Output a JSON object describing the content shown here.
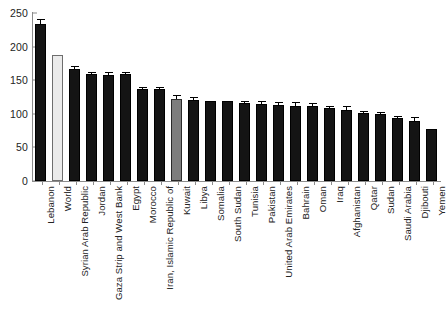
{
  "chart_data": {
    "type": "bar",
    "title": "",
    "subtitle": "",
    "xlabel": "",
    "ylabel": "",
    "ylim": [
      0,
      250
    ],
    "yticks": [
      0,
      50,
      100,
      150,
      200,
      250
    ],
    "grid": false,
    "legend": "none",
    "categories": [
      "Lebanon",
      "World",
      "Syrian Arab Republic",
      "Jordan",
      "Gaza Strip and West Bank",
      "Egypt",
      "Morocco",
      "Iran, Islamic Republic of",
      "Kuwait",
      "Libya",
      "Somalia",
      "South Sudan",
      "Tunisia",
      "Pakistan",
      "United Arab Emirates",
      "Bahrain",
      "Oman",
      "Iraq",
      "Afghanistan",
      "Qatar",
      "Sudan",
      "Saudi Arabia",
      "Djibouti",
      "Yemen"
    ],
    "values": [
      233,
      188,
      167,
      159,
      158,
      159,
      137,
      137,
      122,
      120,
      119,
      119,
      116,
      115,
      113,
      112,
      112,
      108,
      106,
      101,
      99,
      94,
      89,
      77
    ],
    "errors": [
      7,
      0,
      2,
      2,
      3,
      2,
      2,
      2,
      4,
      4,
      0,
      0,
      2,
      2,
      3,
      4,
      2,
      2,
      4,
      2,
      2,
      1,
      5,
      0
    ],
    "bar_styles": [
      "dark",
      "light",
      "dark",
      "dark",
      "dark",
      "dark",
      "dark",
      "dark",
      "gray",
      "dark",
      "dark",
      "dark",
      "dark",
      "dark",
      "dark",
      "dark",
      "dark",
      "dark",
      "dark",
      "dark",
      "dark",
      "dark",
      "dark",
      "dark"
    ],
    "colors": {
      "dark": "#141414",
      "light": "#ebebeb",
      "gray": "#7d7d7d",
      "axis": "#8c8c8c",
      "text": "#232323",
      "background": "#ffffff"
    }
  }
}
